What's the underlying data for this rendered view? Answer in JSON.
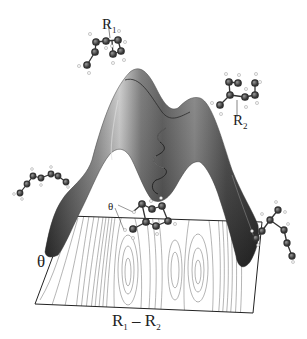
{
  "figure": {
    "type": "potential-energy-surface"
  },
  "labels": {
    "r1": {
      "main": "R",
      "sub": "1"
    },
    "r2": {
      "main": "R",
      "sub": "2"
    },
    "theta_axis": "θ",
    "theta_bond": "θ",
    "x_axis": {
      "a_main": "R",
      "a_sub": "1",
      "sep": " – ",
      "b_main": "R",
      "b_sub": "2"
    }
  },
  "colors": {
    "surface_dark": "#3a3a3a",
    "surface_light": "#bdbdbd",
    "contour": "#6a6a6a",
    "atom_carbon": "#3c3c3c",
    "atom_hydrogen": "#f4f4f4",
    "plane_border": "#222222",
    "trajectory": "#1e1e1e"
  },
  "molecules": [
    {
      "id": "top-left",
      "label": "R1"
    },
    {
      "id": "right-upper",
      "label": "R2"
    },
    {
      "id": "left-chain"
    },
    {
      "id": "center-ring",
      "label": "θ"
    },
    {
      "id": "right-lower"
    }
  ]
}
